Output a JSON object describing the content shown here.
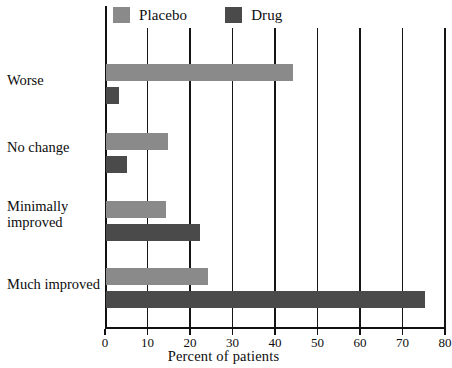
{
  "chart_data": {
    "type": "bar",
    "orientation": "horizontal",
    "title": "",
    "xlabel": "Percent of patients",
    "ylabel": "",
    "xlim": [
      0,
      80
    ],
    "xticks": [
      0,
      10,
      20,
      30,
      40,
      50,
      60,
      70,
      80
    ],
    "xtick_labels": [
      "0",
      "10",
      "20",
      "30",
      "40",
      "50",
      "60",
      "70",
      "80"
    ],
    "grid": "vertical",
    "legend_position": "top-left",
    "categories": [
      "Worse",
      "No change",
      "Minimally improved",
      "Much improved"
    ],
    "category_lines": [
      [
        "Worse"
      ],
      [
        "No change"
      ],
      [
        "Minimally",
        "improved"
      ],
      [
        "Much improved"
      ]
    ],
    "series": [
      {
        "name": "Placebo",
        "color": "#8a8a8a",
        "values": [
          44,
          14.5,
          14,
          24
        ]
      },
      {
        "name": "Drug",
        "color": "#4a4a4a",
        "values": [
          3,
          5,
          22,
          75
        ]
      }
    ]
  },
  "legend": {
    "entries": [
      {
        "label": "Placebo",
        "color": "#8a8a8a"
      },
      {
        "label": "Drug",
        "color": "#4a4a4a"
      }
    ]
  },
  "axis": {
    "x_title": "Percent of patients",
    "ticks": [
      "0",
      "10",
      "20",
      "30",
      "40",
      "50",
      "60",
      "70",
      "80"
    ]
  },
  "categories": {
    "worse": "Worse",
    "no_change": "No change",
    "minimally_improved_line1": "Minimally",
    "minimally_improved_line2": "improved",
    "much_improved": "Much improved"
  }
}
